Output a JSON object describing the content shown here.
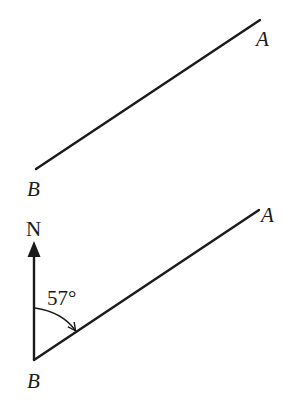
{
  "figure": {
    "top_diagram": {
      "point_a_label": "A",
      "point_b_label": "B",
      "line": {
        "from": [
          36,
          169
        ],
        "to": [
          260,
          20
        ]
      }
    },
    "bottom_diagram": {
      "point_a_label": "A",
      "point_b_label": "B",
      "north_label": "N",
      "bearing_angle_label": "57°",
      "bearing_degrees": 57,
      "line": {
        "from": [
          34,
          360
        ],
        "to": [
          259,
          210
        ]
      },
      "north_arrow": {
        "from": [
          34,
          360
        ],
        "to": [
          34,
          241
        ]
      }
    },
    "colors": {
      "stroke": "#1a1a1a",
      "background": "#ffffff"
    }
  }
}
